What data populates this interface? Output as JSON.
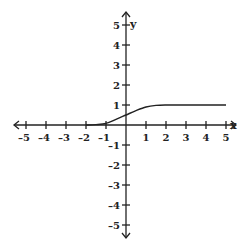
{
  "chart_data": {
    "type": "line",
    "title": "",
    "xlabel": "x",
    "ylabel": "y",
    "xlim": [
      -5,
      5
    ],
    "ylim": [
      -5,
      5
    ],
    "grid": false,
    "x_ticks": [
      -5,
      -4,
      -3,
      -2,
      -1,
      1,
      2,
      3,
      4,
      5
    ],
    "y_ticks": [
      5,
      4,
      3,
      2,
      1,
      -1,
      -2,
      -3,
      -4,
      -5
    ],
    "series": [
      {
        "name": "f(x)",
        "description": "sigmoid-like curve: ~0 for x<=-1, rises through ~0.5 at x=0, levels at 1 for x>=1.5",
        "x": [
          -2,
          -1.5,
          -1,
          -0.5,
          0,
          0.5,
          1,
          1.5,
          2,
          3,
          4,
          5
        ],
        "values": [
          0,
          0.02,
          0.08,
          0.28,
          0.5,
          0.72,
          0.9,
          0.98,
          1,
          1,
          1,
          1
        ]
      }
    ],
    "colors": {
      "axis": "#222222",
      "curve": "#222222",
      "background": "#ffffff"
    }
  }
}
